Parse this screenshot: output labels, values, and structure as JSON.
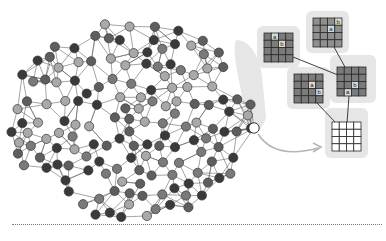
{
  "figure": {
    "type": "diagram",
    "colors": {
      "background": "#ffffff",
      "edge": "#5a5a5a",
      "node_shades": [
        "#3a3a3a",
        "#5e5e5e",
        "#7a7a7a",
        "#a9a9a9"
      ],
      "highlight_node": "#ffffff",
      "neighborhood_shade": "#e4e4e4",
      "arrow": "#b5b5b5",
      "tile_fill": "#7b7b7b",
      "tile_fill_light": "#8f8f8f",
      "output_tile_fill": "#ffffff"
    },
    "network": {
      "node_count_approx": 150,
      "highlighted_node": {
        "x": 254,
        "y": 128
      }
    },
    "tiles": [
      {
        "name": "tile-top",
        "x": 313,
        "y": 18,
        "size": 29,
        "labels": [
          {
            "text": "b",
            "cx": 3,
            "cy": 0
          },
          {
            "text": "a",
            "cx": 2,
            "cy": 1
          }
        ]
      },
      {
        "name": "tile-left",
        "x": 264,
        "y": 33,
        "size": 29,
        "labels": [
          {
            "text": "a",
            "cx": 1,
            "cy": 0
          },
          {
            "text": "b",
            "cx": 2,
            "cy": 1
          }
        ]
      },
      {
        "name": "tile-center",
        "x": 294,
        "y": 74,
        "size": 29,
        "labels": [
          {
            "text": "a",
            "cx": 2,
            "cy": 1
          },
          {
            "text": "b",
            "cx": 3,
            "cy": 2
          }
        ]
      },
      {
        "name": "tile-right",
        "x": 337,
        "y": 67,
        "size": 29,
        "labels": [
          {
            "text": "b",
            "cx": 2,
            "cy": 2
          },
          {
            "text": "a",
            "cx": 1,
            "cy": 3
          }
        ]
      },
      {
        "name": "tile-output",
        "x": 332,
        "y": 122,
        "size": 29,
        "labels": []
      }
    ],
    "labels": {
      "a": "a",
      "b": "b"
    }
  }
}
